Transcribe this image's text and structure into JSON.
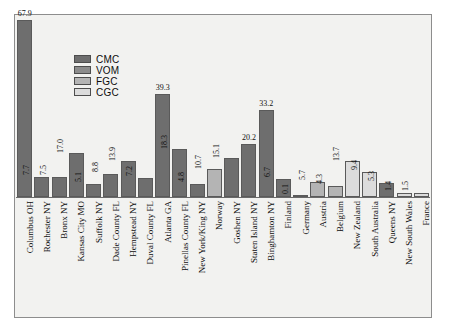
{
  "chart_data": {
    "type": "bar",
    "title": "",
    "subtitle": "",
    "xlabel": "",
    "ylabel": "",
    "ylim": [
      0,
      70
    ],
    "grid": false,
    "legend_position": "inside-upper-left",
    "legend": [
      {
        "name": "CMC",
        "color": "#6e6e6e"
      },
      {
        "name": "VOM",
        "color": "#8c8c8c"
      },
      {
        "name": "FGC",
        "color": "#b4b4b4"
      },
      {
        "name": "CGC",
        "color": "#dcdcdc"
      }
    ],
    "categories": [
      "Columbus OH",
      "Rochester NY",
      "Bronx NY",
      "Kansas City MO",
      "Suffolk NY",
      "Dade County FL",
      "Hempstead NY",
      "Duval County FL",
      "Atlanta GA",
      "Pinellas County FL",
      "New York/King NY",
      "Norway",
      "Goshen NY",
      "Staten Island NY",
      "Binghamton NY",
      "Finland",
      "Germany",
      "Austria",
      "Belgium",
      "New Zealand",
      "South Australia",
      "Queens NY",
      "New South Wales",
      "France"
    ],
    "values": [
      67.9,
      7.7,
      7.5,
      17.0,
      5.1,
      8.8,
      13.9,
      7.2,
      39.3,
      18.3,
      4.8,
      10.7,
      15.1,
      20.2,
      33.2,
      6.7,
      0.1,
      5.7,
      4.3,
      13.7,
      9.4,
      5.3,
      1.4,
      1.5
    ],
    "series_of_bar": [
      "CMC",
      "CMC",
      "CMC",
      "CMC",
      "CMC",
      "CMC",
      "CMC",
      "CMC",
      "CMC",
      "CMC",
      "CMC",
      "FGC",
      "CMC",
      "CMC",
      "CMC",
      "CMC",
      "VOM",
      "FGC",
      "FGC",
      "CGC",
      "CGC",
      "CMC",
      "CGC",
      "CGC"
    ],
    "value_label_orientation": [
      "horizontal",
      "vertical",
      "vertical",
      "vertical",
      "vertical",
      "vertical",
      "vertical",
      "vertical",
      "horizontal",
      "vertical",
      "vertical",
      "vertical",
      "vertical",
      "horizontal",
      "horizontal",
      "vertical",
      "vertical",
      "vertical",
      "vertical",
      "vertical",
      "vertical",
      "vertical",
      "vertical",
      "vertical"
    ]
  }
}
